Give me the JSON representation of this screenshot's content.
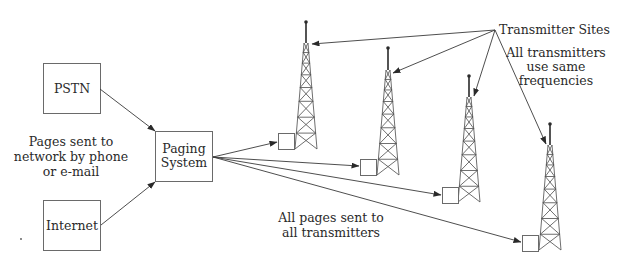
{
  "diagram": {
    "nodes": {
      "pstn": {
        "label": "PSTN",
        "x": 43,
        "y": 63,
        "w": 57,
        "h": 50
      },
      "internet": {
        "label": "Internet",
        "x": 43,
        "y": 200,
        "w": 57,
        "h": 50
      },
      "paging_system": {
        "label_line1": "Paging",
        "label_line2": "System",
        "x": 155,
        "y": 131,
        "w": 57,
        "h": 50
      }
    },
    "annotations": {
      "input_note": {
        "line1": "Pages sent to",
        "line2": "network by phone",
        "line3": "or e-mail"
      },
      "output_note": {
        "line1": "All pages sent to",
        "line2": "all transmitters"
      },
      "transmitter_sites": "Transmitter Sites",
      "frequency_note": {
        "line1": "All transmitters",
        "line2": "use same",
        "line3": "frequencies"
      }
    },
    "transmitters": [
      {
        "id": "tower-1",
        "tip_x": 306,
        "tip_y": 22,
        "lattice_top": 43,
        "base_y": 149,
        "box_x": 278,
        "box_y": 133
      },
      {
        "id": "tower-2",
        "tip_x": 388,
        "tip_y": 48,
        "lattice_top": 70,
        "base_y": 175,
        "box_x": 360,
        "box_y": 159
      },
      {
        "id": "tower-3",
        "tip_x": 469,
        "tip_y": 76,
        "lattice_top": 97,
        "base_y": 202,
        "box_x": 442,
        "box_y": 187
      },
      {
        "id": "tower-4",
        "tip_x": 550,
        "tip_y": 124,
        "lattice_top": 145,
        "base_y": 250,
        "box_x": 522,
        "box_y": 235
      }
    ],
    "edges": [
      {
        "from": "PSTN",
        "to": "Paging System"
      },
      {
        "from": "Internet",
        "to": "Paging System"
      },
      {
        "from": "Paging System",
        "to": "tower-1"
      },
      {
        "from": "Paging System",
        "to": "tower-2"
      },
      {
        "from": "Paging System",
        "to": "tower-3"
      },
      {
        "from": "Paging System",
        "to": "tower-4"
      },
      {
        "from": "Transmitter Sites",
        "to": "tower-1"
      },
      {
        "from": "Transmitter Sites",
        "to": "tower-2"
      },
      {
        "from": "Transmitter Sites",
        "to": "tower-3"
      },
      {
        "from": "Transmitter Sites",
        "to": "tower-4"
      }
    ]
  }
}
